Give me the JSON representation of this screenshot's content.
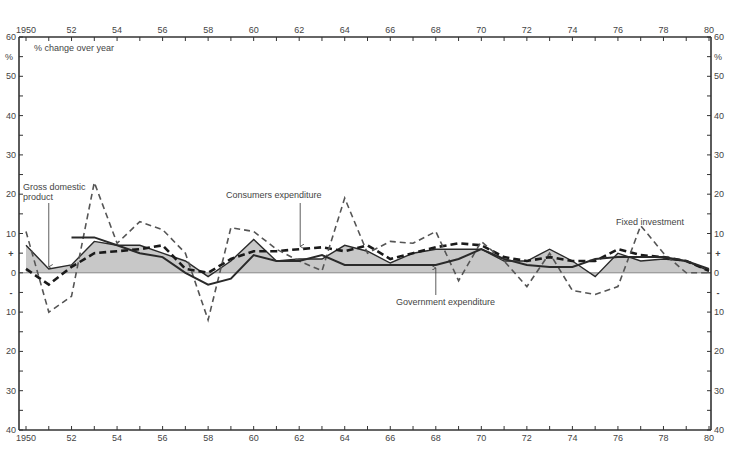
{
  "chart_data": {
    "type": "line",
    "title": "",
    "subtitle": "% change over year",
    "xlabel": "",
    "ylabel": "%",
    "xlim": [
      1950,
      1980
    ],
    "ylim": [
      -40,
      60
    ],
    "grid": false,
    "legend_position": "inline annotations",
    "x_tick_labels": [
      "1950",
      "52",
      "54",
      "56",
      "58",
      "60",
      "62",
      "64",
      "66",
      "68",
      "70",
      "72",
      "74",
      "76",
      "78",
      "80"
    ],
    "x_tick_years": [
      1950,
      1952,
      1954,
      1956,
      1958,
      1960,
      1962,
      1964,
      1966,
      1968,
      1970,
      1972,
      1974,
      1976,
      1978,
      1980
    ],
    "y_ticks": [
      {
        "value": 60,
        "label": "60"
      },
      {
        "value": 50,
        "label": "50"
      },
      {
        "value": 40,
        "label": "40"
      },
      {
        "value": 30,
        "label": "30"
      },
      {
        "value": 20,
        "label": "20"
      },
      {
        "value": 10,
        "label": "10"
      },
      {
        "value": 0,
        "label": "0"
      },
      {
        "value": -10,
        "label": "10"
      },
      {
        "value": -20,
        "label": "20"
      },
      {
        "value": -30,
        "label": "30"
      },
      {
        "value": -40,
        "label": "40"
      }
    ],
    "y_unit_label": "%",
    "plus_sign": "+",
    "minus_sign": "-",
    "x": [
      1950,
      1951,
      1952,
      1953,
      1954,
      1955,
      1956,
      1957,
      1958,
      1959,
      1960,
      1961,
      1962,
      1963,
      1964,
      1965,
      1966,
      1967,
      1968,
      1969,
      1970,
      1971,
      1972,
      1973,
      1974,
      1975,
      1976,
      1977,
      1978,
      1979,
      1980
    ],
    "series": [
      {
        "name": "Gross domestic product",
        "style": "solid-fill",
        "values": [
          7,
          1,
          2,
          8,
          7,
          7,
          5,
          3,
          -1,
          3,
          8.5,
          3,
          3.5,
          3.5,
          7,
          5.5,
          2.5,
          5,
          6,
          6,
          6,
          3,
          3,
          6,
          3,
          -1,
          5,
          3,
          3.5,
          3,
          0.5
        ]
      },
      {
        "name": "Consumers expenditure",
        "style": "thick-dashed",
        "values": [
          1,
          -3,
          1.5,
          5,
          5.5,
          6,
          7,
          1,
          0,
          3.5,
          5.5,
          5.5,
          6,
          6.5,
          5.5,
          7,
          3.5,
          5,
          6.5,
          7.5,
          7,
          4,
          3,
          4,
          3,
          3,
          6,
          4.5,
          4,
          3,
          0.5
        ]
      },
      {
        "name": "Fixed investment",
        "style": "thin-dashed",
        "values": [
          10.5,
          -10,
          -6,
          23,
          7.5,
          13,
          11,
          5,
          -12,
          11.5,
          10.5,
          6,
          3,
          0.5,
          19,
          5,
          8,
          7.5,
          10.5,
          -2,
          8,
          3,
          -3.5,
          5,
          -4.5,
          -5.5,
          -3.5,
          12,
          5,
          0,
          0
        ]
      },
      {
        "name": "Government expenditure",
        "style": "solid",
        "values": [
          null,
          null,
          9,
          9,
          7,
          5,
          4,
          0,
          -3,
          -1.5,
          4.5,
          3,
          3,
          4.5,
          2,
          2,
          2,
          2,
          2,
          3.5,
          6,
          3.5,
          2,
          1.5,
          1.5,
          3.5,
          4,
          4,
          4,
          3,
          1
        ]
      }
    ],
    "annotations": [
      {
        "text_lines": [
          "Gross domestic",
          "product"
        ],
        "series": "Gross domestic product",
        "arrow_year": 1951
      },
      {
        "text_lines": [
          "Consumers expenditure"
        ],
        "series": "Consumers expenditure",
        "arrow_year": 1962
      },
      {
        "text_lines": [
          "Government expenditure"
        ],
        "series": "Government expenditure",
        "arrow_year": 1968
      },
      {
        "text_lines": [
          "Fixed investment"
        ],
        "series": "Fixed investment",
        "arrow_year": null
      }
    ],
    "colors": {
      "axis": "#333333",
      "fill": "#c8c8c8",
      "line": "#2a2a2a",
      "dashed_thin": "#555555",
      "text": "#444444"
    }
  }
}
